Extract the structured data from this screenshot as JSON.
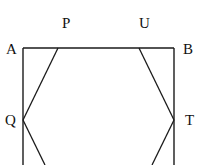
{
  "diagram": {
    "type": "geometry",
    "stroke_color": "#1a1a1a",
    "labels": {
      "A": "A",
      "B": "B",
      "P": "P",
      "U": "U",
      "Q": "Q",
      "T": "T"
    },
    "points": {
      "A": [
        23,
        48
      ],
      "B": [
        174,
        48
      ],
      "P": [
        58,
        48
      ],
      "U": [
        139,
        48
      ],
      "Q": [
        23,
        120
      ],
      "T": [
        174,
        120
      ]
    }
  }
}
